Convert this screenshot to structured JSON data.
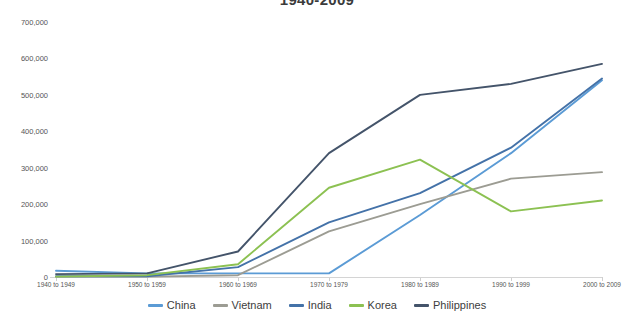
{
  "chart_data": {
    "type": "line",
    "title": "1940-2009",
    "xlabel": "",
    "ylabel": "",
    "categories": [
      "1940 to 1949",
      "1950 to 1959",
      "1960 to 1969",
      "1970 to 1979",
      "1980 to 1989",
      "1990 to 1999",
      "2000 to 2009"
    ],
    "ylim": [
      0,
      700000
    ],
    "y_ticks": [
      0,
      100000,
      200000,
      300000,
      400000,
      500000,
      600000,
      700000
    ],
    "y_tick_labels": [
      "0",
      "100,000",
      "200,000",
      "300,000",
      "400,000",
      "500,000",
      "600,000",
      "700,000"
    ],
    "grid": false,
    "legend_position": "bottom",
    "series": [
      {
        "name": "China",
        "color": "#5b9bd5",
        "values": [
          17000,
          10000,
          10000,
          10000,
          170000,
          340000,
          540000
        ]
      },
      {
        "name": "Vietnam",
        "color": "#9c9c93",
        "values": [
          1000,
          1000,
          5000,
          125000,
          200000,
          270000,
          288000
        ]
      },
      {
        "name": "India",
        "color": "#4472a8",
        "values": [
          2000,
          2000,
          27000,
          150000,
          230000,
          355000,
          545000
        ]
      },
      {
        "name": "Korea",
        "color": "#8cc152",
        "values": [
          1000,
          5000,
          35000,
          245000,
          322000,
          180000,
          210000
        ]
      },
      {
        "name": "Philippines",
        "color": "#44546a",
        "values": [
          8000,
          10000,
          70000,
          340000,
          500000,
          530000,
          585000
        ]
      }
    ]
  }
}
